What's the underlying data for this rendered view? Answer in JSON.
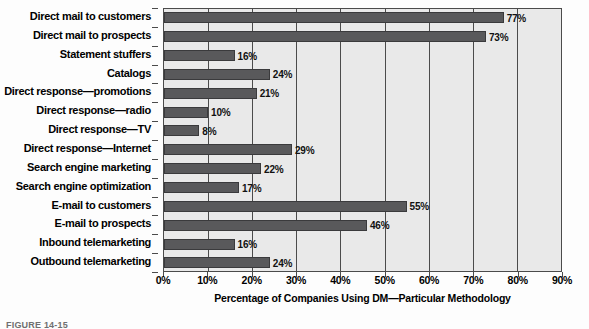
{
  "figure": {
    "caption": "FIGURE 14-15"
  },
  "chart_data": {
    "type": "bar",
    "orientation": "horizontal",
    "title": "",
    "xlabel": "Percentage of Companies Using DM—Particular Methodology",
    "ylabel": "",
    "xlim": [
      0,
      90
    ],
    "xticks": [
      0,
      10,
      20,
      30,
      40,
      50,
      60,
      70,
      80,
      90
    ],
    "xticklabels": [
      "0%",
      "10%",
      "20%",
      "30%",
      "40%",
      "50%",
      "60%",
      "70%",
      "80%",
      "90%"
    ],
    "grid": true,
    "legend": null,
    "value_label_suffix": "%",
    "categories": [
      "Direct mail to customers",
      "Direct mail to prospects",
      "Statement stuffers",
      "Catalogs",
      "Direct response—promotions",
      "Direct response—radio",
      "Direct response—TV",
      "Direct response—Internet",
      "Search engine marketing",
      "Search engine optimization",
      "E-mail to customers",
      "E-mail to prospects",
      "Inbound telemarketing",
      "Outbound telemarketing"
    ],
    "values": [
      77,
      73,
      16,
      24,
      21,
      10,
      8,
      29,
      22,
      17,
      55,
      46,
      16,
      24
    ],
    "value_labels": [
      "77%",
      "73%",
      "16%",
      "24%",
      "21%",
      "10%",
      "8%",
      "29%",
      "22%",
      "17%",
      "55%",
      "46%",
      "16%",
      "24%"
    ],
    "colors": {
      "bar_fill": "#59595b",
      "bar_edge": "#3a3a3c",
      "plot_background": "#e9e9e9",
      "axis": "#4b4b4b",
      "text": "#000000"
    }
  }
}
